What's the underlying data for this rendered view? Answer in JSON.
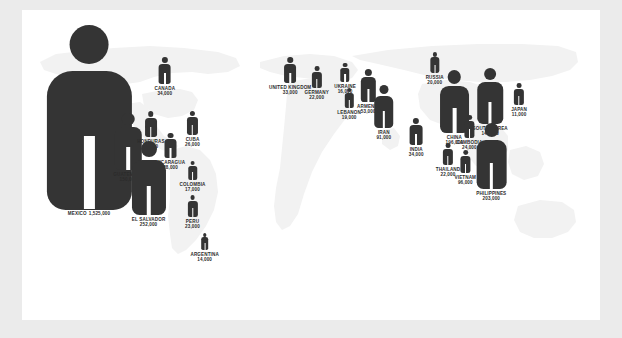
{
  "figure": {
    "type": "pictogram-map",
    "accent_color": "#343434",
    "map_color": "#f2f2f2",
    "panel_color": "#ffffff",
    "page_color": "#ebebeb"
  },
  "chart_data": {
    "type": "pictogram",
    "title": "",
    "xlabel": "",
    "ylabel": "",
    "unit": "people",
    "value_encoding": "pictogram height proportional to square root of value",
    "categories": [
      "MEXICO",
      "EL SALVADOR",
      "PHILIPPINES",
      "CHINA",
      "GUATEMALA",
      "SOUTH KOREA",
      "VIETNAM",
      "IRAN",
      "ARMENIA",
      "CANADA",
      "INDIA",
      "UNITED KINGDOM",
      "HONDURAS",
      "NICARAGUA",
      "CUBA",
      "CAMBODIA",
      "PERU",
      "GERMANY",
      "THAILAND",
      "RUSSIA",
      "LEBANON",
      "COLOMBIA",
      "UKRAINE",
      "ARGENTINA",
      "JAPAN"
    ],
    "values": [
      1525000,
      252000,
      203000,
      196000,
      150000,
      146000,
      96000,
      91000,
      53000,
      34000,
      34000,
      33000,
      31000,
      28000,
      26000,
      24000,
      23000,
      22000,
      22000,
      20000,
      19000,
      17000,
      16000,
      14000,
      11000
    ],
    "markers": [
      {
        "name": "MEXICO",
        "value": "1,525,000",
        "raw": 1525000,
        "x": 11.6,
        "y": 14.5,
        "scale": 185,
        "label_position": "below",
        "label_layout": "inline"
      },
      {
        "name": "CANADA",
        "value": "34,000",
        "raw": 34000,
        "x": 24.7,
        "y": 47.0,
        "scale": 27,
        "label_position": "below",
        "label_layout": "stacked"
      },
      {
        "name": "GUATEMALA",
        "value": "150,000",
        "raw": 150000,
        "x": 18.4,
        "y": 103.0,
        "scale": 57,
        "label_position": "below",
        "label_layout": "stacked"
      },
      {
        "name": "HONDURAS",
        "value": "31,000",
        "raw": 31000,
        "x": 22.3,
        "y": 101.0,
        "scale": 26,
        "label_position": "below",
        "label_layout": "stacked"
      },
      {
        "name": "CUBA",
        "value": "26,000",
        "raw": 26000,
        "x": 29.5,
        "y": 101.0,
        "scale": 24,
        "label_position": "below",
        "label_layout": "stacked"
      },
      {
        "name": "NICARAGUA",
        "value": "28,000",
        "raw": 28000,
        "x": 25.7,
        "y": 123.0,
        "scale": 25,
        "label_position": "below",
        "label_layout": "stacked"
      },
      {
        "name": "EL SALVADOR",
        "value": "252,000",
        "raw": 252000,
        "x": 21.9,
        "y": 131.0,
        "scale": 74,
        "label_position": "below",
        "label_layout": "stacked"
      },
      {
        "name": "COLOMBIA",
        "value": "17,000",
        "raw": 17000,
        "x": 29.5,
        "y": 151.0,
        "scale": 19,
        "label_position": "below",
        "label_layout": "stacked"
      },
      {
        "name": "PERU",
        "value": "23,000",
        "raw": 23000,
        "x": 29.5,
        "y": 185.0,
        "scale": 22,
        "label_position": "below",
        "label_layout": "stacked"
      },
      {
        "name": "ARGENTINA",
        "value": "14,000",
        "raw": 14000,
        "x": 31.6,
        "y": 223.0,
        "scale": 17,
        "label_position": "below",
        "label_layout": "stacked"
      },
      {
        "name": "UNITED KINGDOM",
        "value": "33,000",
        "raw": 33000,
        "x": 46.4,
        "y": 47.0,
        "scale": 26,
        "label_position": "below",
        "label_layout": "stacked"
      },
      {
        "name": "GERMANY",
        "value": "22,000",
        "raw": 22000,
        "x": 51.0,
        "y": 56.0,
        "scale": 22,
        "label_position": "below",
        "label_layout": "stacked"
      },
      {
        "name": "UKRAINE",
        "value": "16,000",
        "raw": 16000,
        "x": 55.9,
        "y": 53.0,
        "scale": 19,
        "label_position": "below",
        "label_layout": "stacked"
      },
      {
        "name": "ARMENIA",
        "value": "53,000",
        "raw": 53000,
        "x": 59.9,
        "y": 59.0,
        "scale": 33,
        "label_position": "below",
        "label_layout": "stacked"
      },
      {
        "name": "LEBANON",
        "value": "19,000",
        "raw": 19000,
        "x": 56.6,
        "y": 78.0,
        "scale": 20,
        "label_position": "below",
        "label_layout": "stacked"
      },
      {
        "name": "IRAN",
        "value": "91,000",
        "raw": 91000,
        "x": 62.6,
        "y": 75.0,
        "scale": 43,
        "label_position": "below",
        "label_layout": "stacked"
      },
      {
        "name": "RUSSIA",
        "value": "20,000",
        "raw": 20000,
        "x": 71.4,
        "y": 42.0,
        "scale": 21,
        "label_position": "below",
        "label_layout": "stacked"
      },
      {
        "name": "CHINA",
        "value": "196,000",
        "raw": 196000,
        "x": 74.8,
        "y": 60.0,
        "scale": 63,
        "label_position": "below",
        "label_layout": "stacked"
      },
      {
        "name": "SOUTH KOREA",
        "value": "146,000",
        "raw": 146000,
        "x": 81.0,
        "y": 58.0,
        "scale": 56,
        "label_position": "below",
        "label_layout": "stacked"
      },
      {
        "name": "JAPAN",
        "value": "11,000",
        "raw": 11000,
        "x": 86.0,
        "y": 73.0,
        "scale": 22,
        "label_position": "below",
        "label_layout": "stacked"
      },
      {
        "name": "INDIA",
        "value": "34,000",
        "raw": 34000,
        "x": 68.2,
        "y": 108.0,
        "scale": 27,
        "label_position": "below",
        "label_layout": "stacked"
      },
      {
        "name": "CAMBODIA",
        "value": "24,000",
        "raw": 24000,
        "x": 77.4,
        "y": 105.0,
        "scale": 23,
        "label_position": "below",
        "label_layout": "stacked"
      },
      {
        "name": "PHILIPPINES",
        "value": "203,000",
        "raw": 203000,
        "x": 81.2,
        "y": 113.0,
        "scale": 66,
        "label_position": "below",
        "label_layout": "stacked"
      },
      {
        "name": "THAILAND",
        "value": "22,000",
        "raw": 22000,
        "x": 73.7,
        "y": 133.0,
        "scale": 22,
        "label_position": "below",
        "label_layout": "stacked"
      },
      {
        "name": "VIETNAM",
        "value": "96,000",
        "raw": 96000,
        "x": 76.7,
        "y": 140.0,
        "scale": 23,
        "label_position": "below",
        "label_layout": "stacked"
      }
    ],
    "dots": [
      {
        "x": 17.2,
        "y": 96.0,
        "size": 2.0
      },
      {
        "x": 21.6,
        "y": 117.0,
        "size": 3.4
      },
      {
        "x": 20.0,
        "y": 148.0,
        "size": 2.0
      }
    ]
  }
}
